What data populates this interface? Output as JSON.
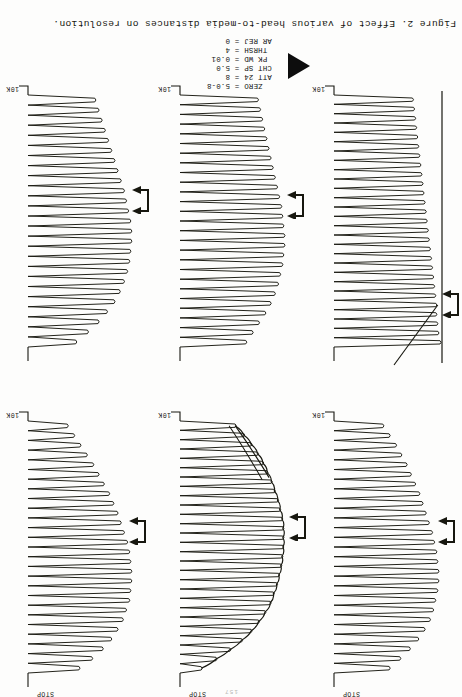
{
  "document": {
    "page_number": "157",
    "caption": "Figure 2.  Effect of various head-to-media distances on resolution.",
    "orientation_note": "scan rotated 180 degrees"
  },
  "parameters": {
    "title": "instrument-settings",
    "rows": [
      {
        "key": "ZERO",
        "eq": "=",
        "value": "5.0-8"
      },
      {
        "key": "ATT 24",
        "eq": "=",
        "value": "8"
      },
      {
        "key": "CHT SP",
        "eq": "=",
        "value": "5.0"
      },
      {
        "key": "PK WD",
        "eq": "=",
        "value": "0.01"
      },
      {
        "key": "THRSH",
        "eq": "=",
        "value": "4"
      },
      {
        "key": "AR REJ",
        "eq": "=",
        "value": "0"
      }
    ]
  },
  "marker": {
    "shape": "solid-triangle",
    "direction": "left",
    "color": "#0d0d0d"
  },
  "chart_data": [
    {
      "id": "chart-top-left",
      "type": "line",
      "title": "",
      "start_label": "10K",
      "stop_label": "",
      "arrow_marker": true,
      "envelope": "linear-ramp",
      "peaks": 27,
      "baseline_axis": true,
      "xlabel": "",
      "ylabel": "",
      "peak_amplitudes": [
        100,
        98,
        97,
        96,
        96,
        95,
        94,
        93,
        92,
        91,
        90,
        89,
        88,
        87,
        86,
        85,
        84,
        83,
        82,
        81,
        80,
        79,
        78,
        77,
        76,
        75,
        74
      ],
      "notes": "diagonal guide line rising from marker toward upper right"
    },
    {
      "id": "chart-top-middle",
      "type": "line",
      "title": "",
      "start_label": "10K",
      "stop_label": "",
      "arrow_marker": true,
      "envelope": "convex-decay",
      "peaks": 26,
      "baseline_axis": false,
      "xlabel": "",
      "ylabel": "",
      "peak_amplitudes": [
        62,
        68,
        74,
        80,
        85,
        89,
        92,
        94,
        96,
        97,
        98,
        98,
        97,
        96,
        95,
        93,
        91,
        89,
        87,
        85,
        83,
        81,
        79,
        77,
        75,
        73
      ]
    },
    {
      "id": "chart-top-right",
      "type": "line",
      "title": "",
      "start_label": "10K",
      "stop_label": "",
      "arrow_marker": true,
      "envelope": "convex-decay",
      "peaks": 25,
      "baseline_axis": false,
      "xlabel": "",
      "ylabel": "",
      "peak_amplitudes": [
        45,
        56,
        66,
        74,
        81,
        86,
        90,
        93,
        95,
        96,
        97,
        97,
        96,
        94,
        92,
        90,
        87,
        84,
        81,
        78,
        75,
        72,
        69,
        66,
        63
      ]
    },
    {
      "id": "chart-bottom-left",
      "type": "line",
      "title": "",
      "start_label": "10K",
      "stop_label": "STOP",
      "arrow_marker": true,
      "envelope": "convex-decay",
      "peaks": 26,
      "baseline_axis": false,
      "xlabel": "",
      "ylabel": "",
      "peak_amplitudes": [
        52,
        62,
        71,
        79,
        85,
        90,
        93,
        95,
        97,
        98,
        98,
        97,
        96,
        94,
        92,
        89,
        86,
        83,
        80,
        76,
        72,
        68,
        63,
        58,
        52,
        46
      ]
    },
    {
      "id": "chart-bottom-middle",
      "type": "line",
      "title": "",
      "start_label": "10K",
      "stop_label": "STOP",
      "arrow_marker": true,
      "envelope": "curved-rollover",
      "peaks": 27,
      "baseline_axis": false,
      "xlabel": "",
      "ylabel": "",
      "peak_amplitudes": [
        20,
        34,
        47,
        58,
        67,
        74,
        80,
        85,
        88,
        91,
        93,
        95,
        96,
        97,
        97,
        97,
        96,
        94,
        92,
        89,
        86,
        82,
        78,
        73,
        67,
        60,
        52
      ],
      "notes": "smooth envelope curve drawn over the peak tips, rolling over at the top"
    },
    {
      "id": "chart-bottom-right",
      "type": "line",
      "title": "",
      "start_label": "10K",
      "stop_label": "STOP",
      "arrow_marker": true,
      "envelope": "convex-decay",
      "peaks": 26,
      "baseline_axis": false,
      "xlabel": "",
      "ylabel": "",
      "peak_amplitudes": [
        48,
        60,
        70,
        78,
        84,
        89,
        92,
        95,
        96,
        97,
        97,
        96,
        95,
        93,
        90,
        87,
        84,
        80,
        76,
        71,
        66,
        61,
        55,
        49,
        43,
        37
      ]
    }
  ]
}
